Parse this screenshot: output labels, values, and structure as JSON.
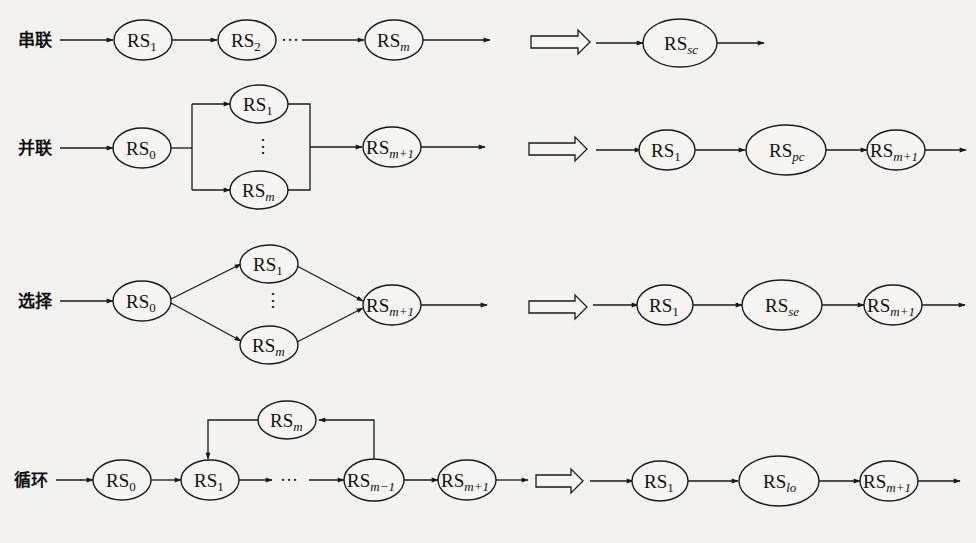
{
  "diagram": {
    "type": "structure-equivalence",
    "rows": [
      {
        "id": "series",
        "label": "串联",
        "left_nodes": [
          {
            "base": "RS",
            "sub": "1",
            "sub_italic": false
          },
          {
            "base": "RS",
            "sub": "2",
            "sub_italic": false
          },
          {
            "base": "RS",
            "sub": "m",
            "sub_italic": true
          }
        ],
        "ellipsis": "···",
        "right_nodes": [
          {
            "base": "RS",
            "sub": "sc",
            "sub_italic": true
          }
        ]
      },
      {
        "id": "parallel",
        "label": "并联",
        "left_nodes": [
          {
            "base": "RS",
            "sub": "0",
            "sub_italic": false
          },
          {
            "base": "RS",
            "sub": "1",
            "sub_italic": false
          },
          {
            "base": "RS",
            "sub": "m",
            "sub_italic": true
          },
          {
            "base": "RS",
            "sub": "m+1",
            "sub_italic": true
          }
        ],
        "ellipsis": "⋮",
        "right_nodes": [
          {
            "base": "RS",
            "sub": "1",
            "sub_italic": false
          },
          {
            "base": "RS",
            "sub": "pc",
            "sub_italic": true
          },
          {
            "base": "RS",
            "sub": "m+1",
            "sub_italic": true
          }
        ]
      },
      {
        "id": "selection",
        "label": "选择",
        "left_nodes": [
          {
            "base": "RS",
            "sub": "0",
            "sub_italic": false
          },
          {
            "base": "RS",
            "sub": "1",
            "sub_italic": false
          },
          {
            "base": "RS",
            "sub": "m",
            "sub_italic": true
          },
          {
            "base": "RS",
            "sub": "m+1",
            "sub_italic": true
          }
        ],
        "ellipsis": "⋮",
        "right_nodes": [
          {
            "base": "RS",
            "sub": "1",
            "sub_italic": false
          },
          {
            "base": "RS",
            "sub": "se",
            "sub_italic": true
          },
          {
            "base": "RS",
            "sub": "m+1",
            "sub_italic": true
          }
        ]
      },
      {
        "id": "loop",
        "label": "循环",
        "left_nodes": [
          {
            "base": "RS",
            "sub": "0",
            "sub_italic": false
          },
          {
            "base": "RS",
            "sub": "1",
            "sub_italic": false
          },
          {
            "base": "RS",
            "sub": "m−1",
            "sub_italic": true
          },
          {
            "base": "RS",
            "sub": "m+1",
            "sub_italic": true
          },
          {
            "base": "RS",
            "sub": "m",
            "sub_italic": true
          }
        ],
        "ellipsis": "···",
        "right_nodes": [
          {
            "base": "RS",
            "sub": "1",
            "sub_italic": false
          },
          {
            "base": "RS",
            "sub": "lo",
            "sub_italic": true
          },
          {
            "base": "RS",
            "sub": "m+1",
            "sub_italic": true
          }
        ]
      }
    ],
    "equivalence_symbol": "hollow-right-arrow",
    "colors": {
      "stroke": "#1a1a1a",
      "background": "#f3f2ef"
    }
  }
}
